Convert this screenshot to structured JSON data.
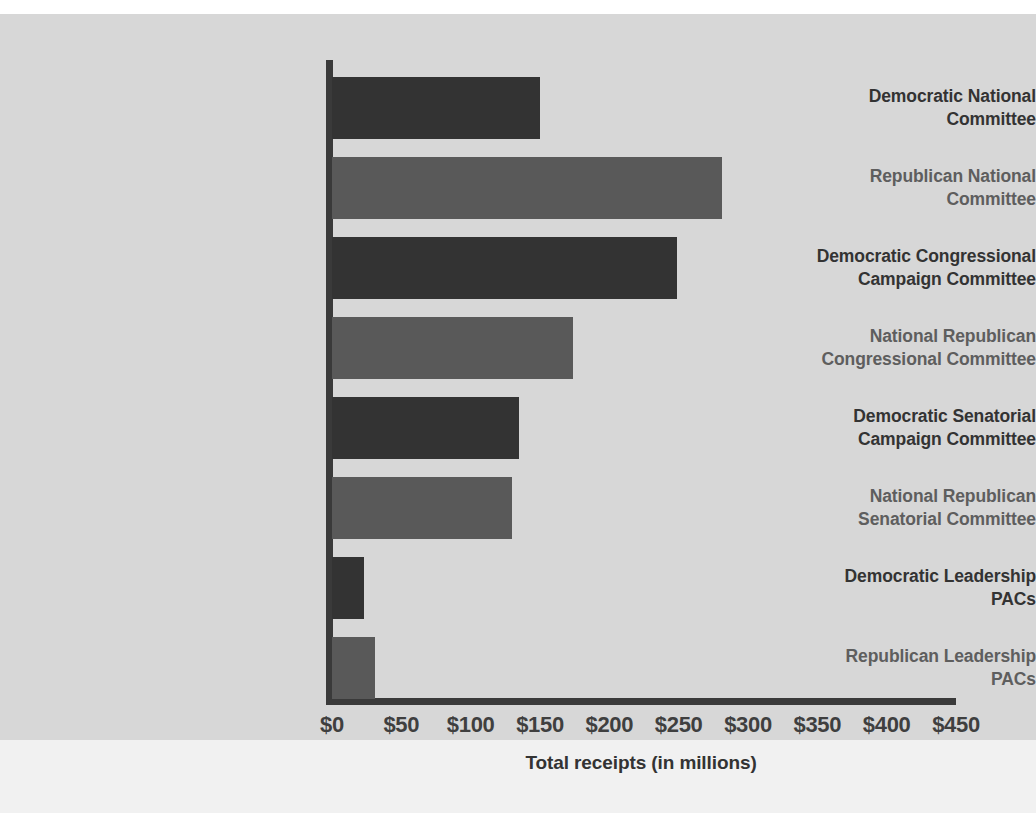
{
  "chart_data": {
    "type": "bar",
    "orientation": "horizontal",
    "title": "",
    "xlabel": "Total receipts (in millions)",
    "ylabel": "",
    "xlim": [
      0,
      450
    ],
    "xticks": [
      0,
      50,
      100,
      150,
      200,
      250,
      300,
      350,
      400,
      450
    ],
    "xtick_labels": [
      "$0",
      "$50",
      "$100",
      "$150",
      "$200",
      "$250",
      "$300",
      "$350",
      "$400",
      "$450"
    ],
    "grid": false,
    "legend": null,
    "categories": [
      "Democratic National Committee",
      "Republican National Committee",
      "Democratic Congressional Campaign Committee",
      "National Republican Congressional Committee",
      "Democratic Senatorial Campaign Committee",
      "National Republican Senatorial Committee",
      "Democratic Leadership PACs",
      "Republican Leadership PACs"
    ],
    "values": [
      150,
      281,
      249,
      174,
      135,
      130,
      23,
      31
    ],
    "bars": [
      {
        "label_lines": [
          "Democratic National",
          "Committee"
        ],
        "value": 150,
        "party": "dem"
      },
      {
        "label_lines": [
          "Republican National",
          "Committee"
        ],
        "value": 281,
        "party": "rep"
      },
      {
        "label_lines": [
          "Democratic Congressional",
          "Campaign Committee"
        ],
        "value": 249,
        "party": "dem"
      },
      {
        "label_lines": [
          "National Republican",
          "Congressional Committee"
        ],
        "value": 174,
        "party": "rep"
      },
      {
        "label_lines": [
          "Democratic Senatorial",
          "Campaign Committee"
        ],
        "value": 135,
        "party": "dem"
      },
      {
        "label_lines": [
          "National Republican",
          "Senatorial Committee"
        ],
        "value": 130,
        "party": "rep"
      },
      {
        "label_lines": [
          "Democratic Leadership",
          "PACs"
        ],
        "value": 23,
        "party": "dem"
      },
      {
        "label_lines": [
          "Republican Leadership",
          "PACs"
        ],
        "value": 31,
        "party": "rep"
      }
    ]
  },
  "colors": {
    "democratic": "#333333",
    "republican": "#595959",
    "axis": "#3a3a3a",
    "plate_background": "#d7d7d7",
    "page_background": "#ffffff"
  }
}
